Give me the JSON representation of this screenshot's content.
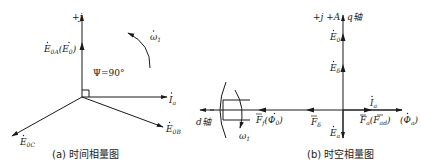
{
  "figure": {
    "panel_a": {
      "caption": "(a) 时间相量图",
      "axis_label": "+j",
      "angle_label": "Ψ=90°",
      "rotation_label": "ω",
      "rotation_sub": "1",
      "phasors": {
        "e0a": {
          "main": "E",
          "sub": "0A",
          "paren_main": "E",
          "paren_sub": "0"
        },
        "ia": {
          "main": "I",
          "sub": "a"
        },
        "e0b": {
          "main": "E",
          "sub": "0B"
        },
        "e0c": {
          "main": "E",
          "sub": "0C"
        }
      }
    },
    "panel_b": {
      "caption": "(b) 时空相量图",
      "q_axis_label": "+j +A",
      "q_axis_name": "q轴",
      "d_axis_name": "d轴",
      "rotation_label": "ω",
      "rotation_sub": "1",
      "phasors": {
        "e0": {
          "main": "E",
          "sub": "0"
        },
        "edelta": {
          "main": "E",
          "sub": "δ"
        },
        "ia": {
          "main": "I",
          "sub": "a"
        },
        "ea": {
          "main": "E",
          "sub": "a"
        },
        "ff": {
          "main": "F",
          "sub": "f",
          "paren_main": "Φ",
          "paren_sub": "0"
        },
        "fdelta": {
          "main": "F",
          "sub": "δ"
        },
        "fa": {
          "main": "F",
          "sub": "a",
          "paren_main": "F",
          "paren_sub": "ad"
        },
        "phia": {
          "main": "Φ",
          "sub": "a"
        }
      }
    }
  }
}
